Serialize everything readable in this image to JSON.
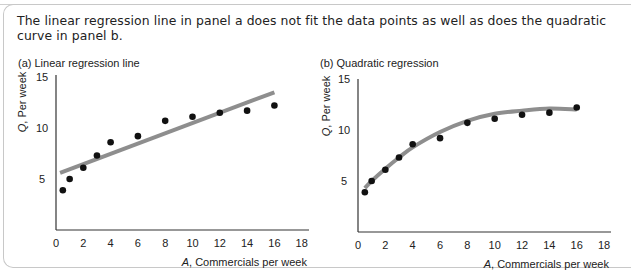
{
  "caption": "The linear regression line in panel a does not fit the data points as well as does the quadratic curve in panel b.",
  "colors": {
    "points": "#111111",
    "fit_line": "#8e8e8e",
    "axis": "#333333",
    "frame": "#c8c8c8"
  },
  "panels": [
    {
      "title": "(a) Linear regression line",
      "ylabel_var": "Q",
      "ylabel_rest": ", Per week",
      "xlabel_var": "A",
      "xlabel_rest": ", Commercials per week"
    },
    {
      "title": "(b) Quadratic regression",
      "ylabel_var": "Q",
      "ylabel_rest": ", Per week",
      "xlabel_var": "A",
      "xlabel_rest": ", Commercials per week"
    }
  ],
  "chart_data": [
    {
      "type": "scatter",
      "title": "(a) Linear regression line",
      "xlabel": "A, Commercials per week",
      "ylabel": "Q, Per week",
      "xlim": [
        0,
        18
      ],
      "ylim": [
        0,
        15
      ],
      "xticks": [
        0,
        2,
        4,
        6,
        8,
        10,
        12,
        14,
        16,
        18
      ],
      "yticks": [
        5,
        10,
        15
      ],
      "grid": false,
      "points": {
        "x": [
          0.5,
          1,
          2,
          3,
          4,
          6,
          8,
          10,
          12,
          14,
          16
        ],
        "y": [
          3.9,
          5.0,
          6.1,
          7.3,
          8.6,
          9.2,
          10.7,
          11.1,
          11.5,
          11.7,
          12.2
        ]
      },
      "fit": {
        "kind": "linear",
        "x_start": 0.3,
        "x_end": 16,
        "y_start": 5.6,
        "y_end": 13.5
      }
    },
    {
      "type": "scatter",
      "title": "(b) Quadratic regression",
      "xlabel": "A, Commercials per week",
      "ylabel": "Q, Per week",
      "xlim": [
        0,
        18
      ],
      "ylim": [
        0,
        15
      ],
      "xticks": [
        0,
        2,
        4,
        6,
        8,
        10,
        12,
        14,
        16,
        18
      ],
      "yticks": [
        5,
        10,
        15
      ],
      "grid": false,
      "points": {
        "x": [
          0.5,
          1,
          2,
          3,
          4,
          6,
          8,
          10,
          12,
          14,
          16
        ],
        "y": [
          3.9,
          5.0,
          6.1,
          7.3,
          8.6,
          9.2,
          10.7,
          11.1,
          11.5,
          11.7,
          12.2
        ]
      },
      "fit": {
        "kind": "quadratic",
        "x_start": 0.5,
        "x_end": 16,
        "curve_y": [
          4.3,
          5.0,
          6.2,
          7.3,
          8.3,
          9.8,
          10.9,
          11.6,
          11.9,
          12.1,
          12.0
        ]
      }
    }
  ]
}
